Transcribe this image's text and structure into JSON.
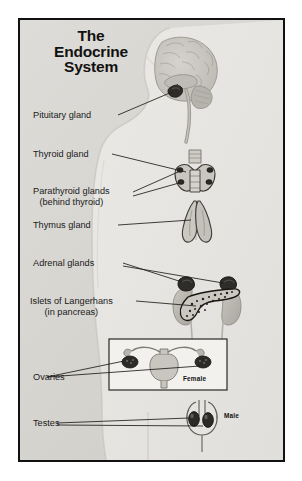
{
  "poster": {
    "title_lines": [
      "The",
      "Endocrine",
      "System"
    ],
    "background_color": "#d8d6d1",
    "frame_color": "#111111",
    "text_color": "#1a1a1a"
  },
  "labels": [
    {
      "id": "pituitary",
      "text": "Pituitary gland"
    },
    {
      "id": "thyroid",
      "text": "Thyroid gland"
    },
    {
      "id": "parathyroid",
      "text": "Parathyroid glands",
      "sub": "(behind thyroid)"
    },
    {
      "id": "thymus",
      "text": "Thymus gland"
    },
    {
      "id": "adrenal",
      "text": "Adrenal glands"
    },
    {
      "id": "islets",
      "text": "Islets of Langerhans",
      "sub": "(in pancreas)"
    },
    {
      "id": "ovaries",
      "text": "Ovaries"
    },
    {
      "id": "testes",
      "text": "Testes"
    }
  ],
  "insets": {
    "female_caption": "Female",
    "male_caption": "Male"
  }
}
